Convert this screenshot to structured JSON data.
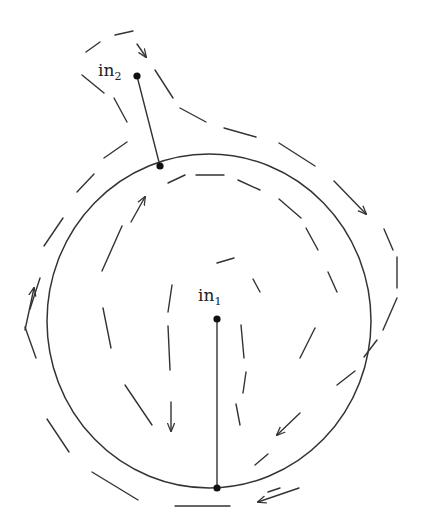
{
  "diagram": {
    "type": "flow-field-around-circle",
    "stroke_color": "#333333",
    "circle": {
      "cx": 209,
      "cy": 321,
      "rx": 162,
      "ry": 167
    },
    "points": [
      {
        "id": "in1",
        "label_base": "in",
        "label_sub": "1",
        "x": 217,
        "y": 319,
        "label_x": 198,
        "label_y": 289,
        "boundary_x": 217,
        "boundary_y": 488
      },
      {
        "id": "in2",
        "label_base": "in",
        "label_sub": "2",
        "x": 137,
        "y": 76,
        "label_x": 98,
        "label_y": 64,
        "boundary_x": 160,
        "boundary_y": 166
      }
    ],
    "outer_dashes": [
      [
        86,
        52,
        100,
        42
      ],
      [
        115,
        35,
        133,
        31
      ],
      [
        155,
        70,
        173,
        98
      ],
      [
        180,
        108,
        206,
        122
      ],
      [
        224,
        128,
        256,
        137
      ],
      [
        279,
        143,
        315,
        166
      ],
      [
        384,
        229,
        393,
        250
      ],
      [
        397,
        257,
        397,
        288
      ],
      [
        397,
        298,
        383,
        330
      ],
      [
        377,
        340,
        364,
        357
      ],
      [
        355,
        371,
        337,
        385
      ],
      [
        280,
        488,
        268,
        492
      ],
      [
        175,
        506,
        230,
        506
      ],
      [
        92,
        472,
        138,
        500
      ],
      [
        47,
        419,
        69,
        452
      ],
      [
        25,
        327,
        36,
        358
      ],
      [
        40,
        278,
        30,
        309
      ],
      [
        44,
        246,
        63,
        218
      ],
      [
        77,
        192,
        94,
        174
      ],
      [
        104,
        158,
        127,
        142
      ],
      [
        82,
        75,
        104,
        93
      ],
      [
        114,
        98,
        127,
        122
      ]
    ],
    "outer_arrows": [
      {
        "from": [
          137,
          44
        ],
        "to": [
          146,
          57
        ]
      },
      {
        "from": [
          334,
          181
        ],
        "to": [
          366,
          214
        ]
      },
      {
        "from": [
          299,
          488
        ],
        "to": [
          258,
          502
        ]
      },
      {
        "from": [
          25,
          330
        ],
        "to": [
          34,
          288
        ]
      }
    ],
    "inner_dashes": [
      [
        168,
        183,
        185,
        175
      ],
      [
        196,
        175,
        224,
        175
      ],
      [
        238,
        180,
        260,
        190
      ],
      [
        279,
        199,
        301,
        218
      ],
      [
        306,
        228,
        318,
        250
      ],
      [
        328,
        272,
        337,
        292
      ],
      [
        315,
        353,
        300,
        383
      ],
      [
        268,
        454,
        255,
        465
      ],
      [
        240,
        425,
        236,
        406
      ],
      [
        245,
        397,
        250,
        375
      ],
      [
        236,
        337,
        241,
        356
      ],
      [
        242,
        367,
        246,
        368
      ],
      [
        178,
        247,
        173,
        252
      ],
      [
        181,
        275,
        188,
        270
      ],
      [
        176,
        353,
        171,
        375
      ],
      [
        102,
        271,
        122,
        226
      ],
      [
        125,
        263,
        128,
        260
      ],
      [
        103,
        308,
        111,
        348
      ],
      [
        125,
        385,
        152,
        425
      ],
      [
        170,
        373,
        170,
        394
      ],
      [
        171,
        420,
        171,
        432
      ]
    ],
    "inner_arrows": [
      {
        "from": [
          131,
          222
        ],
        "to": [
          145,
          197
        ]
      },
      {
        "from": [
          171,
          402
        ],
        "to": [
          171,
          431
        ]
      },
      {
        "from": [
          300,
          413
        ],
        "to": [
          277,
          435
        ]
      }
    ],
    "inner_loop_dashes": [
      [
        217,
        263,
        234,
        258
      ],
      [
        253,
        279,
        260,
        292
      ],
      [
        241,
        325,
        244,
        358
      ],
      [
        246,
        372,
        243,
        393
      ],
      [
        172,
        285,
        168,
        312
      ],
      [
        168,
        326,
        170,
        370
      ]
    ]
  }
}
